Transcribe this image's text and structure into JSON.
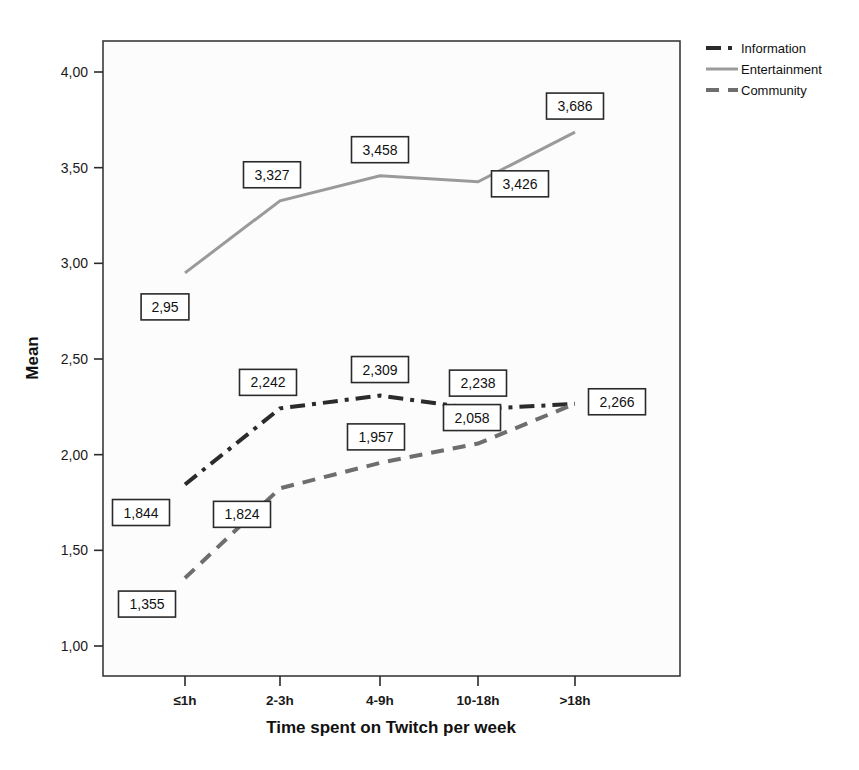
{
  "chart_data": {
    "type": "line",
    "title": "",
    "xlabel": "Time spent on Twitch per week",
    "ylabel": "Mean",
    "categories": [
      "≤1h",
      "2-3h",
      "4-9h",
      "10-18h",
      ">18h"
    ],
    "ylim": [
      1.0,
      4.0
    ],
    "y_ticks": [
      "1,00",
      "1,50",
      "2,00",
      "2,50",
      "3,00",
      "3,50",
      "4,00"
    ],
    "y_tick_values": [
      1.0,
      1.5,
      2.0,
      2.5,
      3.0,
      3.5,
      4.0
    ],
    "grid": false,
    "legend_position": "top-right",
    "series": [
      {
        "name": "Information",
        "values": [
          1.844,
          2.242,
          2.309,
          2.238,
          2.266
        ],
        "labels": [
          "1,844",
          "2,242",
          "2,309",
          "2,238",
          "2,266"
        ],
        "color": "#2b2b2b",
        "dash": "dashdot",
        "width": 4
      },
      {
        "name": "Entertainment",
        "values": [
          2.95,
          3.327,
          3.458,
          3.426,
          3.686
        ],
        "labels": [
          "2,95",
          "3,327",
          "3,458",
          "3,426",
          "3,686"
        ],
        "color": "#9a9a9a",
        "dash": "solid",
        "width": 3
      },
      {
        "name": "Community",
        "values": [
          1.355,
          1.824,
          1.957,
          2.058,
          2.266
        ],
        "labels": [
          "1,355",
          "1,824",
          "1,957",
          "2,058",
          ""
        ],
        "color": "#6e6e6e",
        "dash": "dashed",
        "width": 4
      }
    ]
  },
  "legend": {
    "items": [
      {
        "label": "Information"
      },
      {
        "label": "Entertainment"
      },
      {
        "label": "Community"
      }
    ]
  },
  "axes": {
    "y_title": "Mean",
    "x_title": "Time spent on Twitch per week"
  }
}
